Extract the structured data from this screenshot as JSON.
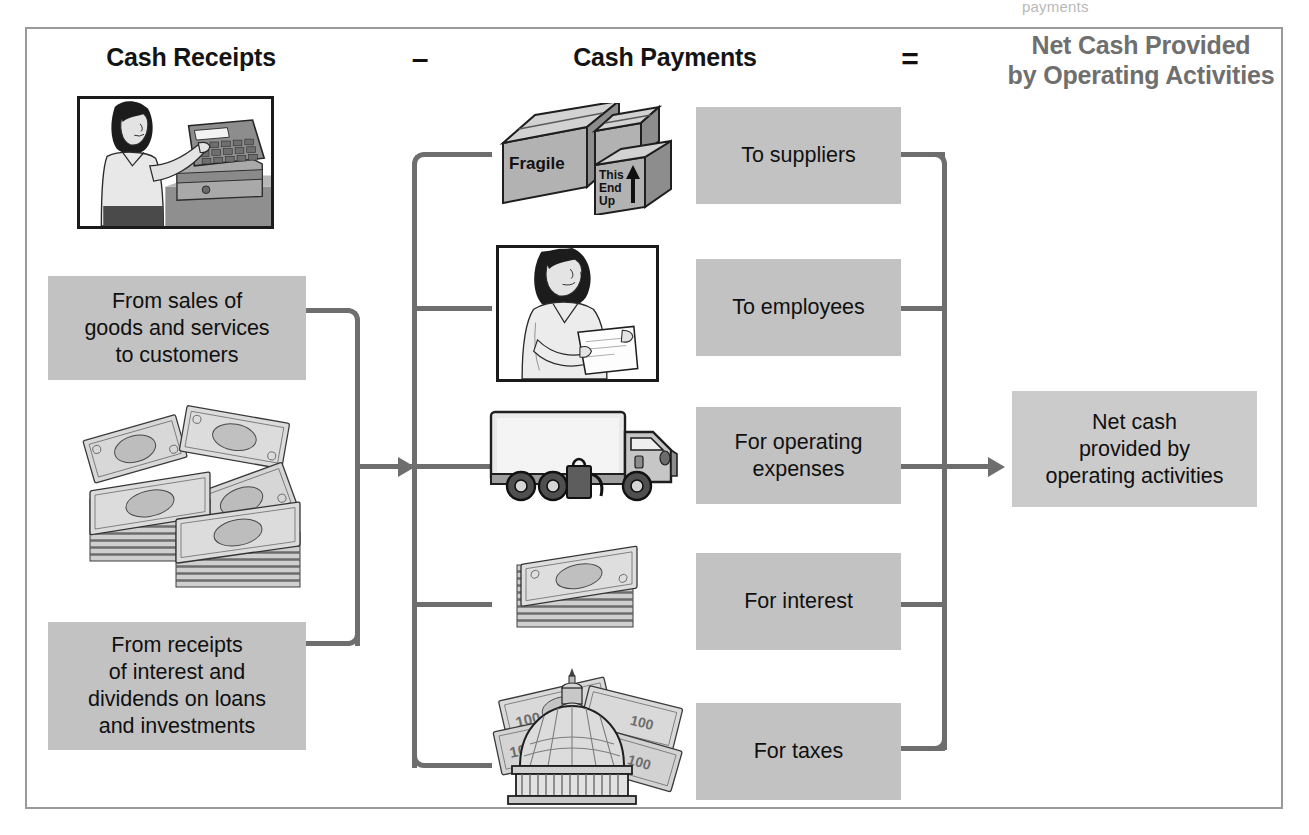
{
  "ghost": {
    "top_text": "payments"
  },
  "headings": {
    "receipts": "Cash Receipts",
    "minus": "–",
    "payments": "Cash Payments",
    "equals": "=",
    "result_line1": "Net Cash Provided",
    "result_line2": "by Operating Activities"
  },
  "receipts": {
    "items": [
      {
        "label": "From sales of\ngoods and services\nto customers",
        "illustration": "cash-register-clerk-illustration"
      },
      {
        "label": "From receipts\nof interest and\ndividends on loans\nand investments",
        "illustration": "money-stacks-illustration"
      }
    ]
  },
  "payments": {
    "items": [
      {
        "label": "To suppliers",
        "illustration": "shipping-boxes-illustration",
        "box_labels": [
          "Fragile",
          "This",
          "End",
          "Up"
        ]
      },
      {
        "label": "To employees",
        "illustration": "employee-paycheck-illustration"
      },
      {
        "label": "For operating\nexpenses",
        "illustration": "delivery-truck-illustration"
      },
      {
        "label": "For interest",
        "illustration": "bill-stack-illustration"
      },
      {
        "label": "For taxes",
        "illustration": "capitol-dome-money-illustration",
        "bill_labels": [
          "100",
          "100",
          "100",
          "100"
        ]
      }
    ]
  },
  "result": {
    "label": "Net cash\nprovided by\noperating activities"
  },
  "colors": {
    "box_fill": "#c2c2c2",
    "result_fill": "#cbcbcb",
    "connector": "#6e6e6e",
    "frame_border": "#9a9a9a",
    "heading_dark": "#141414",
    "heading_gray": "#6f6f6f"
  }
}
